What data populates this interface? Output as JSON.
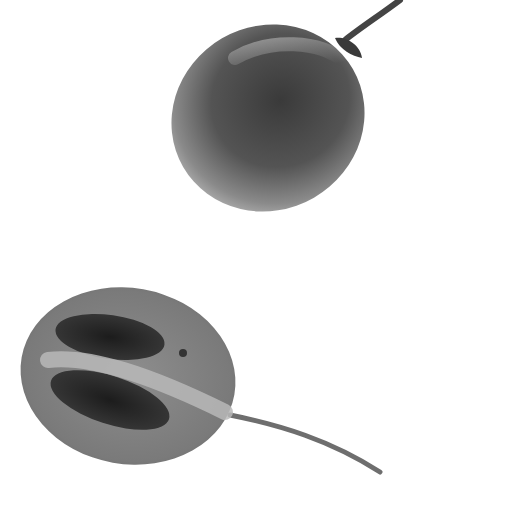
{
  "image": {
    "subject": "Two tamarillo fruits, grayscale photo",
    "background": "#ffffff",
    "objects": [
      {
        "name": "whole-fruit",
        "description": "Whole egg-shaped fruit with stem at top right"
      },
      {
        "name": "halved-fruit",
        "description": "Fruit cut in half lengthwise showing dark seed cavities and long stem"
      }
    ]
  }
}
